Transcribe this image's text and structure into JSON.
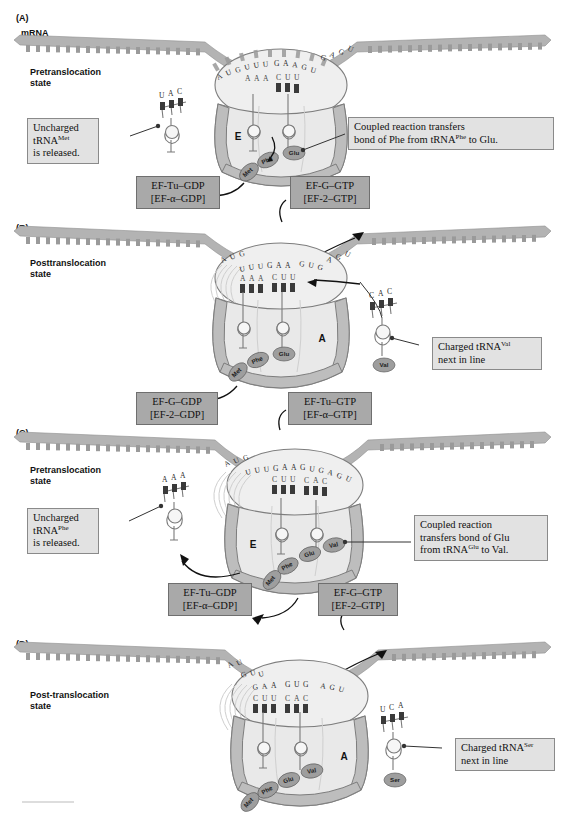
{
  "figure": {
    "mrna_label": "mRNA",
    "caption_rule": true
  },
  "panels": [
    {
      "id": "A",
      "letter": "(A)",
      "state": "Pretranslocation\nstate",
      "state_line1": "Pretranslocation",
      "state_line2": "state",
      "mrna_sequence_top": "A U G U U U G A A G U G A G U",
      "mrna_codons": [
        "AUG",
        "UUU",
        "GAA",
        "GUG",
        "AGU"
      ],
      "anticodons_in_ribosome": [
        "AAA",
        "CUU"
      ],
      "sites_shown": [
        "E"
      ],
      "free_trna": {
        "anticodon": "UAC",
        "charged": false
      },
      "peptide_chain": [
        "Met",
        "Phe",
        "Glu"
      ],
      "callouts": [
        {
          "name": "uncharged-trna-note",
          "text": "Uncharged tRNAMet is released.",
          "line1": "Uncharged",
          "line2_pre": "tRNA",
          "line2_sup": "Met",
          "line3": "is released."
        },
        {
          "name": "coupled-reaction-note",
          "line1": "Coupled reaction transfers",
          "line2_pre": "bond of Phe from tRNA",
          "line2_sup": "Phe",
          "line2_post": " to Glu."
        }
      ],
      "factor_boxes": [
        {
          "name": "ef-tu-gdp-box",
          "line1": "EF-Tu–GDP",
          "line2": "[EF-α–GDP]"
        },
        {
          "name": "ef-g-gtp-box",
          "line1": "EF-G–GTP",
          "line2": "[EF-2–GTP]"
        }
      ]
    },
    {
      "id": "B",
      "letter": "(B)",
      "state_line1": "Posttranslocation",
      "state_line2": "state",
      "mrna_codons": [
        "AUG",
        "UUU",
        "GAA",
        "GUG",
        "AGU"
      ],
      "anticodons_in_ribosome": [
        "AAA",
        "CUU"
      ],
      "sites_shown": [
        "A"
      ],
      "incoming_trna": {
        "anticodon": "CAC",
        "amino_acid": "Val",
        "charged": true
      },
      "peptide_chain": [
        "Met",
        "Phe",
        "Glu"
      ],
      "callouts": [
        {
          "name": "charged-trna-val-note",
          "line1_pre": "Charged tRNA",
          "line1_sup": "Val",
          "line2": "next in line"
        }
      ],
      "factor_boxes": [
        {
          "name": "ef-g-gdp-box",
          "line1": "EF-G–GDP",
          "line2": "[EF-2–GDP]"
        },
        {
          "name": "ef-tu-gtp-box",
          "line1": "EF-Tu–GTP",
          "line2": "[EF-α–GTP]"
        }
      ]
    },
    {
      "id": "C",
      "letter": "(C)",
      "state_line1": "Pretranslocation",
      "state_line2": "state",
      "mrna_codons": [
        "AUG",
        "UUU",
        "GAA",
        "GUG",
        "AGU"
      ],
      "anticodons_in_ribosome": [
        "CUU",
        "CAC"
      ],
      "sites_shown": [
        "E"
      ],
      "free_trna": {
        "anticodon": "AAA",
        "charged": false
      },
      "peptide_chain": [
        "Met",
        "Phe",
        "Glu",
        "Val"
      ],
      "callouts": [
        {
          "name": "uncharged-trna-phe-note",
          "line1": "Uncharged",
          "line2_pre": "tRNA",
          "line2_sup": "Phe",
          "line3": "is released."
        },
        {
          "name": "coupled-reaction-glu-note",
          "line1": "Coupled reaction",
          "line2": "transfers bond of Glu",
          "line3_pre": "from tRNA",
          "line3_sup": "Glu",
          "line3_post": " to Val."
        }
      ],
      "factor_boxes": [
        {
          "name": "ef-tu-gdp-box",
          "line1": "EF-Tu–GDP",
          "line2": "[EF-α–GDP]"
        },
        {
          "name": "ef-g-gtp-box",
          "line1": "EF-G–GTP",
          "line2": "[EF-2–GTP]"
        }
      ]
    },
    {
      "id": "D",
      "letter": "(D)",
      "state_line1": "Post-translocation",
      "state_line2": "state",
      "mrna_codons": [
        "AUG",
        "UUU",
        "GAA",
        "GUG",
        "AGU"
      ],
      "anticodons_in_ribosome": [
        "CUU",
        "CAC"
      ],
      "sites_shown": [
        "A"
      ],
      "incoming_trna": {
        "anticodon": "UCA",
        "amino_acid": "Ser",
        "charged": true
      },
      "peptide_chain": [
        "Met",
        "Phe",
        "Glu",
        "Val"
      ],
      "callouts": [
        {
          "name": "charged-trna-ser-note",
          "line1_pre": "Charged tRNA",
          "line1_sup": "Ser",
          "line2": "next in line"
        }
      ],
      "factor_boxes": []
    }
  ],
  "colors": {
    "mrna": "#b3b3b3",
    "ribosome_large": "#e9e9e9",
    "ribosome_small": "#efefef",
    "ribosome_band": "#bdbdbd",
    "amino_acid": "#9e9e9e",
    "callout_box": "#e2e2e2",
    "factor_box": "#a9a9a9",
    "text": "#111111"
  }
}
